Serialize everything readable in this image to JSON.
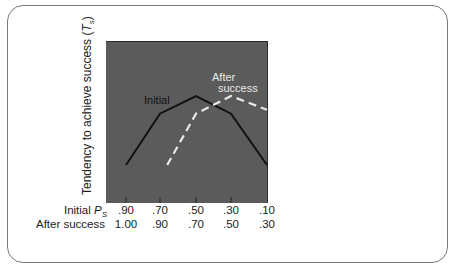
{
  "chart_data": {
    "type": "line",
    "title": "",
    "ylabel": "Tendency to achieve success (T_s)",
    "ylabel_parts": {
      "text": "Tendency to achieve success (",
      "var": "T",
      "sub": "s",
      "close": ")"
    },
    "xlabel_rows": [
      {
        "label": "Initial P",
        "label_var": "P",
        "label_sub": "S",
        "label_prefix": "Initial ",
        "ticks": [
          ".90",
          ".70",
          ".50",
          ".30",
          ".10"
        ]
      },
      {
        "label": "After success",
        "ticks": [
          "1.00",
          ".90",
          ".70",
          ".50",
          ".30"
        ]
      }
    ],
    "x_positions": [
      0,
      1,
      2,
      3,
      4
    ],
    "grid": false,
    "series": [
      {
        "name": "Initial",
        "style": "solid",
        "color": "#111111",
        "x": [
          0,
          1,
          2,
          3,
          4
        ],
        "values": [
          1.0,
          2.3,
          2.75,
          2.3,
          1.0
        ]
      },
      {
        "name": "After success",
        "style": "dashed",
        "color": "#e8e8e8",
        "x": [
          1.2,
          2,
          3,
          4
        ],
        "values": [
          1.0,
          2.3,
          2.75,
          2.4
        ]
      }
    ],
    "annotations": [
      {
        "text": "Initial",
        "near_series": "Initial"
      },
      {
        "text": "After success",
        "lines": [
          "After",
          "success"
        ],
        "near_series": "After success"
      }
    ],
    "plot_background": "#5b5b5b"
  },
  "labels": {
    "initial_annotation": "Initial",
    "after_line1": "After",
    "after_line2": "success",
    "row1_prefix": "Initial ",
    "row1_var": "P",
    "row1_sub": "S",
    "row2": "After success",
    "ylabel_text": "Tendency to achieve success (",
    "ylabel_var": "T",
    "ylabel_sub": "s",
    "ylabel_close": ")"
  },
  "ticks_row1": [
    ".90",
    ".70",
    ".50",
    ".30",
    ".10"
  ],
  "ticks_row2": [
    "1.00",
    ".90",
    ".70",
    ".50",
    ".30"
  ]
}
